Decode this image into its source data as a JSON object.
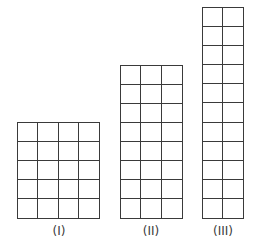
{
  "figures": [
    {
      "id": "I",
      "label": "(I)",
      "cols": 4,
      "rows": 5,
      "x": 17,
      "y": 122,
      "w": 83,
      "h": 97,
      "label_x": 59
    },
    {
      "id": "II",
      "label": "(II)",
      "cols": 3,
      "rows": 8,
      "x": 120,
      "y": 65,
      "w": 63,
      "h": 154,
      "label_x": 151
    },
    {
      "id": "III",
      "label": "(III)",
      "cols": 2,
      "rows": 11,
      "x": 202,
      "y": 7,
      "w": 42,
      "h": 212,
      "label_x": 223
    }
  ],
  "colors": {
    "line": "#3a3a3a",
    "background": "#ffffff"
  }
}
